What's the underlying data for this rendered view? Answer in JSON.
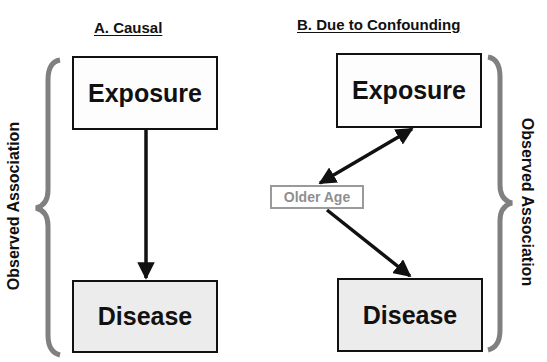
{
  "panel_a": {
    "title": "A. Causal",
    "exposure_label": "Exposure",
    "disease_label": "Disease",
    "side_label": "Observed Association"
  },
  "panel_b": {
    "title": "B. Due to Confounding",
    "exposure_label": "Exposure",
    "confounder_label": "Older Age",
    "disease_label": "Disease",
    "side_label": "Observed Association"
  },
  "colors": {
    "line": "#111111",
    "brace": "#808080",
    "confounder": "#9a9a9a",
    "disease_fill": "#ececec"
  }
}
